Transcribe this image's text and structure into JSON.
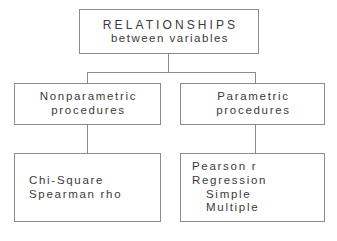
{
  "diagram": {
    "title": "RELATIONSHIPS between variables",
    "type": "hierarchy-flowchart",
    "border_color": "#8c8c8c",
    "text_color": "#3a3a3a",
    "background_color": "#ffffff",
    "nodes": {
      "root": {
        "line1": "RELATIONSHIPS",
        "line2": "between variables"
      },
      "nonparametric": {
        "line1": "Nonparametric",
        "line2": "procedures"
      },
      "parametric": {
        "line1": "Parametric",
        "line2": "procedures"
      },
      "nonparametric_tests": {
        "line1": "Chi-Square",
        "line2": "Spearman rho"
      },
      "parametric_tests": {
        "line1": "Pearson r",
        "line2": "Regression",
        "line3": "Simple",
        "line4": "Multiple"
      }
    }
  }
}
